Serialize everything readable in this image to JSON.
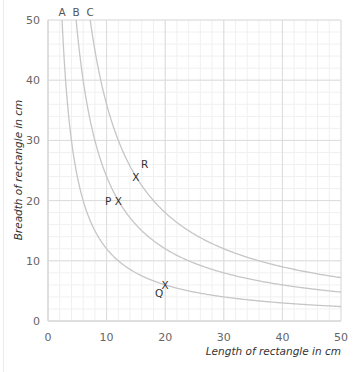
{
  "chart_data": {
    "type": "line",
    "title": "",
    "xlabel": "Length of rectangle in cm",
    "ylabel": "Breadth of rectangle in cm",
    "xlim": [
      0,
      50
    ],
    "ylim": [
      0,
      50
    ],
    "x_ticks": [
      0,
      10,
      20,
      30,
      40,
      50
    ],
    "y_ticks": [
      0,
      10,
      20,
      30,
      40,
      50
    ],
    "grid": true,
    "minor_grid_step": 2,
    "series": [
      {
        "name": "A",
        "equation": "x*y = 120",
        "area": 120
      },
      {
        "name": "B",
        "equation": "x*y = 240",
        "area": 240
      },
      {
        "name": "C",
        "equation": "x*y = 360",
        "area": 360
      }
    ],
    "points": [
      {
        "label": "P",
        "x": 12,
        "y": 20,
        "curve": "B"
      },
      {
        "label": "Q",
        "x": 20,
        "y": 6,
        "curve": "A"
      },
      {
        "label": "R",
        "x": 15,
        "y": 24,
        "curve": "C"
      }
    ],
    "marker": "X"
  }
}
